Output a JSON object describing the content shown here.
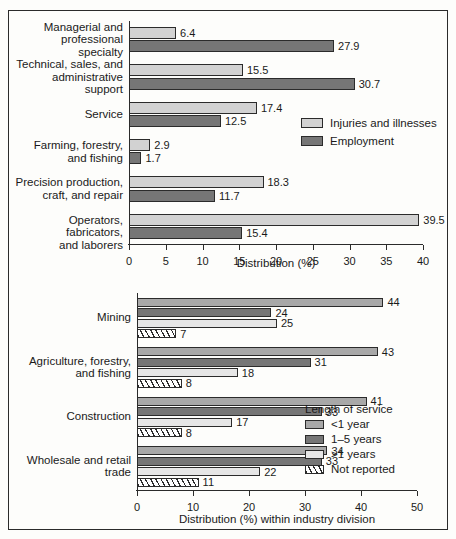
{
  "figure": {
    "frame_border_color": "#2b2b2b",
    "background": "#fdfdfb"
  },
  "chart_data": [
    {
      "type": "bar",
      "orientation": "horizontal",
      "id": "occupation-chart",
      "title": "",
      "xlabel": "Distribution (%)",
      "ylabel": "",
      "xlim": [
        0,
        40
      ],
      "xticks": [
        0,
        5,
        10,
        15,
        20,
        25,
        30,
        35,
        40
      ],
      "xticklabels": [
        "0",
        "5",
        "10",
        "15",
        "20",
        "25",
        "30",
        "35",
        "40"
      ],
      "grid": false,
      "legend_position": "right-middle",
      "categories": [
        "Managerial and\nprofessional\nspecialty",
        "Technical, sales, and\nadministrative\nsupport",
        "Service",
        "Farming, forestry,\nand fishing",
        "Precision production,\ncraft, and repair",
        "Operators, fabricators,\nand laborers"
      ],
      "series": [
        {
          "name": "Injuries and illnesses",
          "color": "#d2d2d2",
          "values": [
            6.4,
            15.5,
            17.4,
            2.9,
            18.3,
            39.5
          ],
          "labels": [
            "6.4",
            "15.5",
            "17.4",
            "2.9",
            "18.3",
            "39.5"
          ]
        },
        {
          "name": "Employment",
          "color": "#767676",
          "values": [
            27.9,
            30.7,
            12.5,
            1.7,
            11.7,
            15.4
          ],
          "labels": [
            "27.9",
            "30.7",
            "12.5",
            "1.7",
            "11.7",
            "15.4"
          ]
        }
      ]
    },
    {
      "type": "bar",
      "orientation": "horizontal",
      "id": "industry-chart",
      "title": "",
      "xlabel": "Distribution (%) within industry division",
      "ylabel": "",
      "xlim": [
        0,
        50
      ],
      "xticks": [
        0,
        10,
        20,
        30,
        40,
        50
      ],
      "xticklabels": [
        "0",
        "10",
        "20",
        "30",
        "40",
        "50"
      ],
      "grid": false,
      "legend_title": "Length of service",
      "legend_position": "right-bottom",
      "categories": [
        "Mining",
        "Agriculture, forestry,\nand fishing",
        "Construction",
        "Wholesale and retail\ntrade"
      ],
      "series": [
        {
          "name": "<1 year",
          "color": "#a8a8a8",
          "pattern": "solid",
          "values": [
            44,
            43,
            41,
            34
          ],
          "labels": [
            "44",
            "43",
            "41",
            "34"
          ]
        },
        {
          "name": "1–5 years",
          "color": "#767676",
          "pattern": "solid",
          "values": [
            24,
            31,
            33,
            33
          ],
          "labels": [
            "24",
            "31",
            "33",
            "33"
          ]
        },
        {
          "name": ">1 years",
          "color": "#e6e6e6",
          "pattern": "solid",
          "values": [
            25,
            18,
            17,
            22
          ],
          "labels": [
            "25",
            "18",
            "17",
            "22"
          ]
        },
        {
          "name": "Not reported",
          "color": "#ffffff",
          "pattern": "hatched",
          "values": [
            7,
            8,
            8,
            11
          ],
          "labels": [
            "7",
            "8",
            "8",
            "11"
          ]
        }
      ]
    }
  ]
}
